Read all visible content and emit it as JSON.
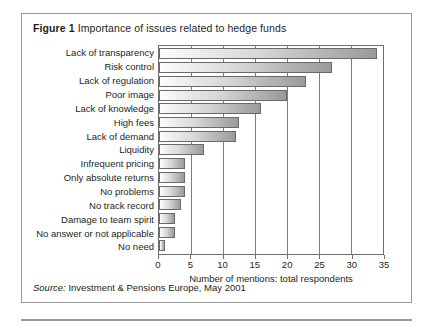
{
  "figure": {
    "label": "Figure 1",
    "title": "Importance of issues related to hedge funds",
    "source_lead": "Source:",
    "source_text": "Investment & Pensions Europe, May 2001"
  },
  "chart_data": {
    "type": "bar",
    "orientation": "horizontal",
    "title": "Importance of issues related to hedge funds",
    "xlabel": "Number of mentions: total respondents",
    "ylabel": "",
    "xlim": [
      0,
      35
    ],
    "xticks": [
      0,
      5,
      10,
      15,
      20,
      25,
      30,
      35
    ],
    "grid": true,
    "legend": "none",
    "categories": [
      "Lack of transparency",
      "Risk control",
      "Lack of regulation",
      "Poor image",
      "Lack of knowledge",
      "High fees",
      "Lack of demand",
      "Liquidity",
      "Infrequent pricing",
      "Only absolute returns",
      "No problems",
      "No track record",
      "Damage to team spirit",
      "No answer or not applicable",
      "No need"
    ],
    "values": [
      34,
      27,
      23,
      20,
      16,
      12.5,
      12,
      7,
      4,
      4,
      4,
      3.5,
      2.5,
      2.5,
      1
    ]
  },
  "colors": {
    "frame": "#9a9a9a",
    "axis": "#6e6e6e",
    "bar_outline": "#6a6a6a",
    "bar_fill_start": "#fdfdfd",
    "bar_fill_end": "#9a9a9a",
    "text": "#231f20"
  }
}
